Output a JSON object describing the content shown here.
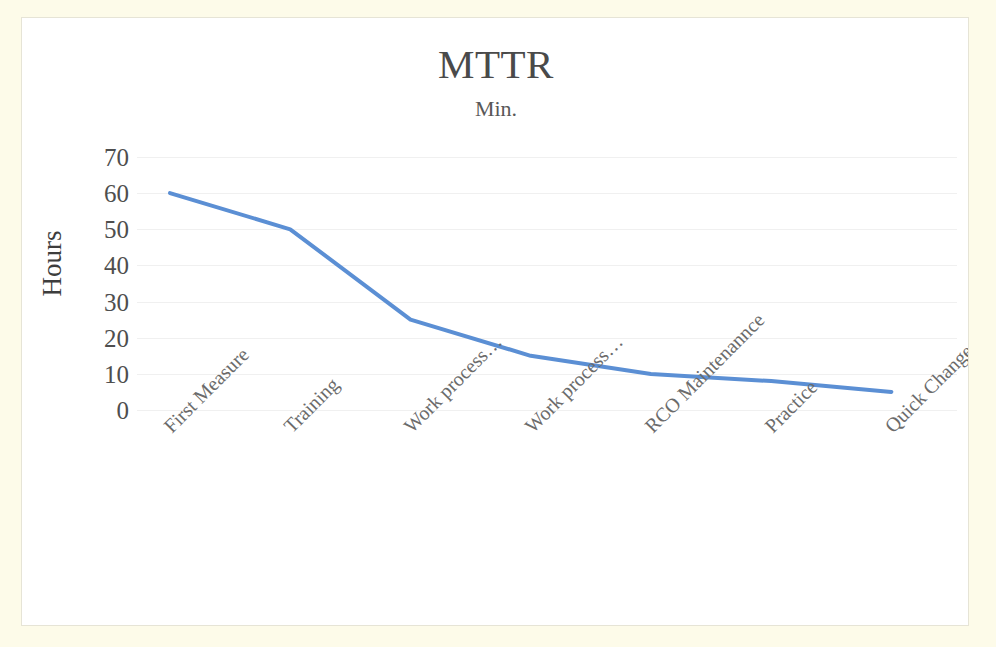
{
  "chart": {
    "title": "MTTR",
    "subtitle": "Min.",
    "y_axis_title": "Hours",
    "line_color": "#5B8FD4",
    "gridline_color": "#F0F0F0",
    "background_color": "#FFFFFF",
    "page_background_color": "#FDFBE9"
  },
  "chart_data": {
    "type": "line",
    "title": "MTTR",
    "subtitle": "Min.",
    "xlabel": "",
    "ylabel": "Hours",
    "ylim": [
      0,
      70
    ],
    "yticks": [
      0,
      10,
      20,
      30,
      40,
      50,
      60,
      70
    ],
    "ytick_labels": [
      "0",
      "10",
      "20",
      "30",
      "40",
      "50",
      "60",
      "70"
    ],
    "grid": true,
    "legend": "none",
    "categories": [
      "First Measure",
      "Training",
      "Work process…",
      "Work process…",
      "RCO Maintenannce",
      "Practice",
      "Quick Change Parts"
    ],
    "series": [
      {
        "name": "MTTR",
        "values": [
          60,
          50,
          25,
          15,
          10,
          8,
          5
        ],
        "color": "#5B8FD4"
      }
    ]
  }
}
